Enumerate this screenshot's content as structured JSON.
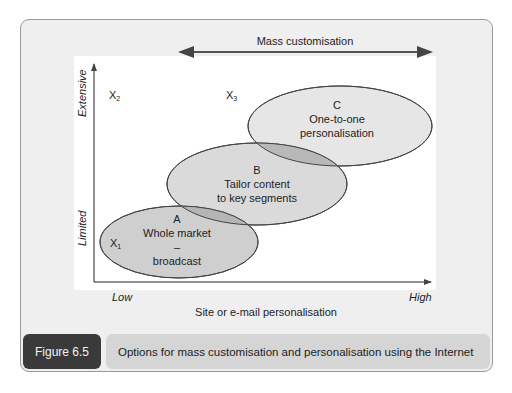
{
  "top_arrow": {
    "label": "Mass customisation"
  },
  "y_axis": {
    "high_label": "Extensive",
    "low_label": "Limited"
  },
  "x_axis": {
    "low_label": "Low",
    "high_label": "High",
    "title": "Site or e-mail personalisation"
  },
  "markers": [
    {
      "letter": "X",
      "sub": "1"
    },
    {
      "letter": "X",
      "sub": "2"
    },
    {
      "letter": "X",
      "sub": "3"
    }
  ],
  "ellipses": [
    {
      "id": "A",
      "letter": "A",
      "line1": "Whole market",
      "line2": "–",
      "line3": "broadcast",
      "fill": "#cfcfcf"
    },
    {
      "id": "B",
      "letter": "B",
      "line1": "Tailor content",
      "line2": "to key segments",
      "fill": "#dadada"
    },
    {
      "id": "C",
      "letter": "C",
      "line1": "One-to-one",
      "line2": "personalisation",
      "fill": "#e6e6e6"
    }
  ],
  "overlap_fill": "#b5b5b5",
  "figure": {
    "label": "Figure 6.5",
    "caption": "Options for mass customisation and personalisation using the Internet"
  }
}
